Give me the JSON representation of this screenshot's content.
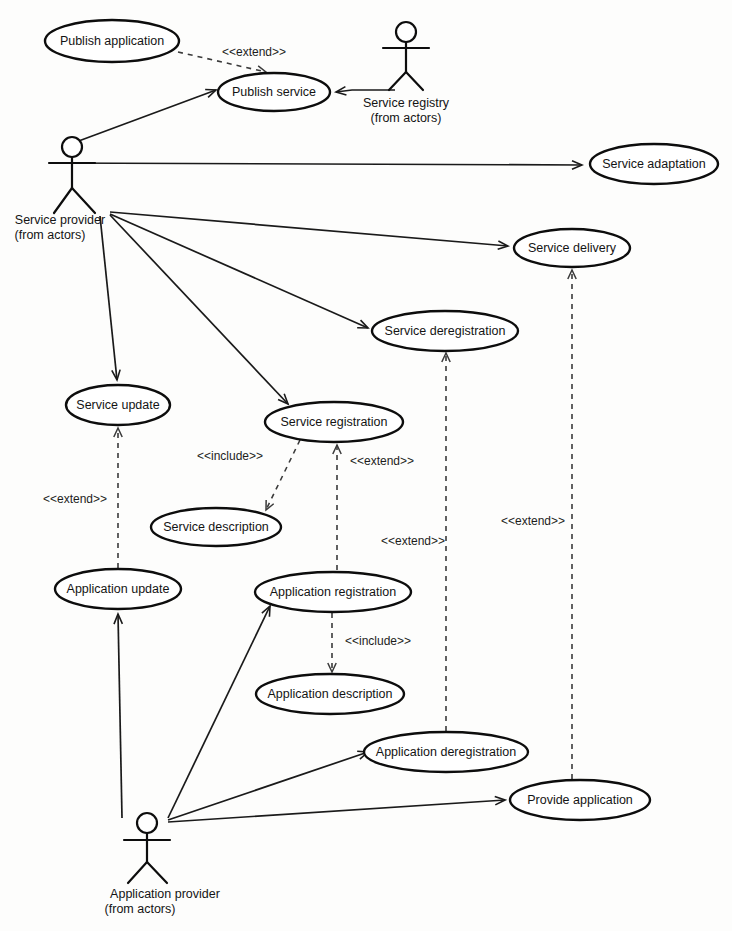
{
  "diagram": {
    "kind": "uml-use-case-diagram",
    "width": 732,
    "height": 931,
    "background_color": "#fdfdfc",
    "stroke_color": "#0d0d0d",
    "text_color": "#141414"
  },
  "actors": [
    {
      "id": "service-registry",
      "name": "Service registry",
      "qualifier": "(from actors)",
      "x": 406,
      "y": 32
    },
    {
      "id": "service-provider",
      "name": "Service provider",
      "qualifier": "(from actors)",
      "x": 72,
      "y": 147
    },
    {
      "id": "application-provider",
      "name": "Application provider",
      "qualifier": "(from actors)",
      "x": 147,
      "y": 823
    }
  ],
  "use_cases": [
    {
      "id": "publish-application",
      "label": "Publish application",
      "cx": 112,
      "cy": 41,
      "rx": 67,
      "ry": 21
    },
    {
      "id": "publish-service",
      "label": "Publish service",
      "cx": 274,
      "cy": 92,
      "rx": 56,
      "ry": 19
    },
    {
      "id": "service-adaptation",
      "label": "Service adaptation",
      "cx": 654,
      "cy": 164,
      "rx": 64,
      "ry": 20
    },
    {
      "id": "service-delivery",
      "label": "Service delivery",
      "cx": 572,
      "cy": 248,
      "rx": 58,
      "ry": 19
    },
    {
      "id": "service-deregistration",
      "label": "Service deregistration",
      "cx": 445,
      "cy": 331,
      "rx": 73,
      "ry": 20
    },
    {
      "id": "service-update",
      "label": "Service update",
      "cx": 118,
      "cy": 405,
      "rx": 52,
      "ry": 20
    },
    {
      "id": "service-registration",
      "label": "Service registration",
      "cx": 334,
      "cy": 422,
      "rx": 69,
      "ry": 20
    },
    {
      "id": "service-description",
      "label": "Service description",
      "cx": 216,
      "cy": 527,
      "rx": 65,
      "ry": 19
    },
    {
      "id": "application-update",
      "label": "Application update",
      "cx": 118,
      "cy": 589,
      "rx": 63,
      "ry": 20
    },
    {
      "id": "application-registration",
      "label": "Application registration",
      "cx": 333,
      "cy": 592,
      "rx": 78,
      "ry": 20
    },
    {
      "id": "application-description",
      "label": "Application description",
      "cx": 330,
      "cy": 694,
      "rx": 74,
      "ry": 20
    },
    {
      "id": "application-deregistration",
      "label": "Application deregistration",
      "cx": 446,
      "cy": 752,
      "rx": 82,
      "ry": 20
    },
    {
      "id": "provide-application",
      "label": "Provide application",
      "cx": 580,
      "cy": 800,
      "rx": 70,
      "ry": 20
    }
  ],
  "associations": [
    {
      "from": "service-provider",
      "to": "publish-service",
      "arrow": true
    },
    {
      "from": "service-registry",
      "to": "publish-service",
      "arrow": true
    },
    {
      "from": "service-provider",
      "to": "service-adaptation",
      "arrow": true
    },
    {
      "from": "service-provider",
      "to": "service-delivery",
      "arrow": true
    },
    {
      "from": "service-provider",
      "to": "service-deregistration",
      "arrow": true
    },
    {
      "from": "service-provider",
      "to": "service-update",
      "arrow": true
    },
    {
      "from": "service-provider",
      "to": "service-registration",
      "arrow": true
    },
    {
      "from": "application-provider",
      "to": "application-update",
      "arrow": true
    },
    {
      "from": "application-provider",
      "to": "application-registration",
      "arrow": true
    },
    {
      "from": "application-provider",
      "to": "application-deregistration",
      "arrow": true
    },
    {
      "from": "application-provider",
      "to": "provide-application",
      "arrow": true
    }
  ],
  "dependencies": [
    {
      "from": "publish-application",
      "to": "publish-service",
      "stereotype": "<<extend>>",
      "label_x": 254,
      "label_y": 56
    },
    {
      "from": "service-registration",
      "to": "service-description",
      "stereotype": "<<include>>",
      "label_x": 230,
      "label_y": 458
    },
    {
      "from": "application-update",
      "to": "service-update",
      "stereotype": "<<extend>>",
      "label_x": 75,
      "label_y": 501
    },
    {
      "from": "application-registration",
      "to": "service-registration",
      "stereotype": "<<extend>>",
      "label_x": 382,
      "label_y": 463
    },
    {
      "from": "application-registration",
      "to": "application-description",
      "stereotype": "<<include>>",
      "label_x": 378,
      "label_y": 643
    },
    {
      "from": "application-deregistration",
      "to": "service-deregistration",
      "stereotype": "<<extend>>",
      "label_x": 413,
      "label_y": 543
    },
    {
      "from": "provide-application",
      "to": "service-delivery",
      "stereotype": "<<extend>>",
      "label_x": 533,
      "label_y": 523
    }
  ],
  "stereotypes": {
    "extend": "<<extend>>",
    "include": "<<include>>"
  }
}
